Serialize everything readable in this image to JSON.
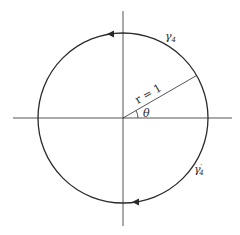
{
  "diagram": {
    "type": "unit-circle-contour",
    "colors": {
      "stroke": "#2a2a2a",
      "background": "#ffffff"
    },
    "labels": {
      "radius": "r = 1",
      "angle": "θ",
      "upper_contour": "γ",
      "upper_contour_subscript": "4",
      "lower_contour": "γ",
      "lower_contour_prime": "′",
      "lower_contour_subscript": "4"
    },
    "geometry": {
      "center": [
        123,
        118
      ],
      "radius": 85,
      "radius_angle_deg": 30,
      "arrow_directions": [
        "counterclockwise-top",
        "leftward-bottom"
      ]
    }
  }
}
